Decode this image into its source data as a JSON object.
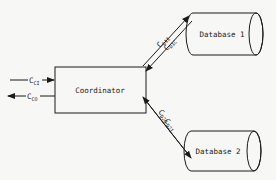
{
  "diagram": {
    "nodes": {
      "coordinator": {
        "label": "Coordinator"
      },
      "database1": {
        "label": "Database 1"
      },
      "database2": {
        "label": "Database 2"
      }
    },
    "edges": {
      "left_in": {
        "base": "C",
        "sub": "CI",
        "direction": "into coordinator"
      },
      "left_out": {
        "base": "C",
        "sub": "CO",
        "direction": "out of coordinator"
      },
      "db1_out": {
        "base": "C",
        "sub": "D1I",
        "direction": "coordinator to database 1"
      },
      "db1_in": {
        "base": "C",
        "sub": "D1C",
        "direction": "database 1 to coordinator"
      },
      "db2_out": {
        "base": "C",
        "sub": "D2O",
        "direction": "database 2 to coordinator"
      },
      "db2_in": {
        "base": "C",
        "sub": "D2I",
        "direction": "coordinator to database 2"
      }
    }
  },
  "colors": {
    "line": "#1a1a1a",
    "background": "#f7f7f5",
    "ghost_text": "#d9d9d6"
  }
}
